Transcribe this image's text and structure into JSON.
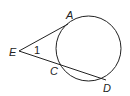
{
  "diagram": {
    "type": "geometry",
    "points": {
      "E": {
        "label": "E"
      },
      "A": {
        "label": "A"
      },
      "C": {
        "label": "C"
      },
      "D": {
        "label": "D"
      }
    },
    "angle_label": "1",
    "segments": [
      "EA",
      "ED"
    ],
    "stroke_color": "#222222"
  }
}
